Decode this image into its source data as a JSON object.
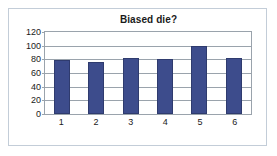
{
  "chart_data": {
    "type": "bar",
    "title": "Biased die?",
    "xlabel": "",
    "ylabel": "",
    "categories": [
      "1",
      "2",
      "3",
      "4",
      "5",
      "6"
    ],
    "values": [
      79,
      76,
      82,
      80,
      100,
      82
    ],
    "series": [
      {
        "name": "Frequency",
        "values": [
          79,
          76,
          82,
          80,
          100,
          82
        ]
      }
    ],
    "ylim": [
      0,
      120
    ],
    "yticks": [
      0,
      20,
      40,
      60,
      80,
      100,
      120
    ],
    "ytick_labels": [
      "0",
      "20",
      "40",
      "60",
      "80",
      "100",
      "120"
    ],
    "grid": true,
    "grid_axis": "y",
    "legend": false,
    "bar_color": "#3d4c8c",
    "bar_edge_color": "#2f3b6e",
    "plot_background": "#ffffff",
    "gridline_color": "#9aa3ac",
    "frame_border_color": "#c3cdd8"
  }
}
